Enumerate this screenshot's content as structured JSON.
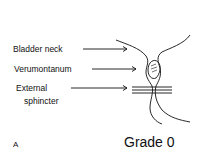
{
  "labels": {
    "bladder_neck": "Bladder neck",
    "verumontanum": "Verumontanum",
    "external": "External",
    "sphincter": "sphincter"
  },
  "panel_letter": "A",
  "grade": "Grade 0"
}
